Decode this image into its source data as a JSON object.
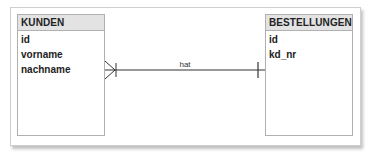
{
  "diagram": {
    "type": "entity-relationship",
    "entities": [
      {
        "name": "KUNDEN",
        "attributes": [
          "id",
          "vorname",
          "nachname"
        ]
      },
      {
        "name": "BESTELLUNGEN",
        "attributes": [
          "id",
          "kd_nr"
        ]
      }
    ],
    "relationship": {
      "label": "hat",
      "from": "KUNDEN",
      "to": "BESTELLUNGEN",
      "from_cardinality": "one-or-many (crow's foot)",
      "to_cardinality": "one"
    },
    "colors": {
      "header_bg": "#e3e3e3",
      "border": "#b0b0b0",
      "line": "#333333"
    }
  }
}
